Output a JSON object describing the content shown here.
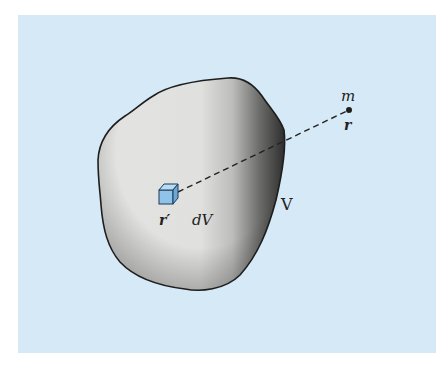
{
  "figure": {
    "labels": {
      "point_mass": "m",
      "point_position": "r",
      "element_position": "r′",
      "volume_element": "dV",
      "volume": "V"
    },
    "colors": {
      "background_panel": "#d6e9f6",
      "body_fill_light": "#e6e6e4",
      "body_fill_dark": "#3a3a3a",
      "outline": "#1e1e1e",
      "cube_fill": "#8fc3ea",
      "cube_top": "#b9dcf5",
      "cube_side": "#6aa8d8",
      "dashed_line": "#222222"
    }
  }
}
